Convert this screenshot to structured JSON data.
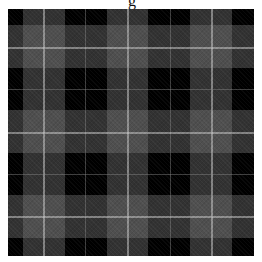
{
  "image": {
    "subject": "grayscale tartan plaid fabric pattern",
    "title_fragment": "g",
    "colors": {
      "base": "#000000",
      "band": "#787878",
      "light_line": "#bdbdbd",
      "faint_line": "#5a5a5a"
    },
    "vertical_bands": [
      {
        "x": 15,
        "w": 42
      },
      {
        "x": 99,
        "w": 41
      },
      {
        "x": 182,
        "w": 42
      }
    ],
    "horizontal_bands": [
      {
        "y": 16,
        "h": 43
      },
      {
        "y": 101,
        "h": 43
      },
      {
        "y": 186,
        "h": 43
      }
    ],
    "vertical_lines": [
      {
        "x": 35,
        "type": "light"
      },
      {
        "x": 77,
        "type": "faint"
      },
      {
        "x": 119,
        "type": "light"
      },
      {
        "x": 162,
        "type": "faint"
      },
      {
        "x": 203,
        "type": "light"
      }
    ],
    "horizontal_lines": [
      {
        "y": 38,
        "type": "light"
      },
      {
        "y": 80,
        "type": "faint"
      },
      {
        "y": 123,
        "type": "light"
      },
      {
        "y": 165,
        "type": "faint"
      },
      {
        "y": 207,
        "type": "light"
      }
    ]
  }
}
